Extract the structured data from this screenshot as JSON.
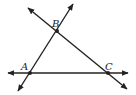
{
  "diagram": {
    "type": "geometry-lines",
    "stroke_color": "#222222",
    "points": [
      {
        "label": "A",
        "x": 30,
        "y": 73,
        "lx": 21,
        "ly": 70
      },
      {
        "label": "B",
        "x": 57,
        "y": 31,
        "lx": 52,
        "ly": 27
      },
      {
        "label": "C",
        "x": 108,
        "y": 73,
        "lx": 105,
        "ly": 70
      }
    ],
    "lines": [
      {
        "name": "line-AC",
        "x1": 8,
        "y1": 73,
        "x2": 128,
        "y2": 73
      },
      {
        "name": "line-AB",
        "x1": 18,
        "y1": 91,
        "x2": 73,
        "y2": 4
      },
      {
        "name": "line-BC",
        "x1": 28,
        "y1": 8,
        "x2": 127,
        "y2": 89
      }
    ]
  }
}
